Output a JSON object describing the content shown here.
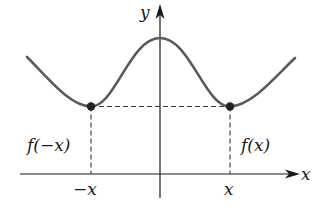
{
  "diagram": {
    "axes": {
      "x_label": "x",
      "y_label": "y"
    },
    "points": [
      {
        "id": "left",
        "tick_label": "−x",
        "value_label": "f(−x)"
      },
      {
        "id": "right",
        "tick_label": "x",
        "value_label": "f(x)"
      }
    ],
    "colors": {
      "curve": "#5a5a5a",
      "axis": "#1a1a1a",
      "dashed": "#3a3a3a",
      "point": "#222222"
    }
  }
}
